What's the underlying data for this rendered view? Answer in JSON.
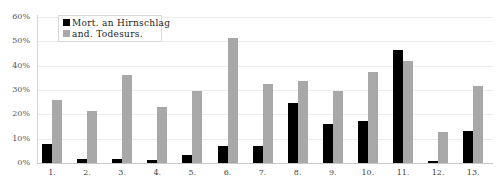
{
  "chart_data": {
    "type": "bar",
    "title": "",
    "xlabel": "",
    "ylabel": "",
    "categories": [
      "1.",
      "2.",
      "3.",
      "4.",
      "5.",
      "6.",
      "7.",
      "8.",
      "9.",
      "10.",
      "11.",
      "12.",
      "13."
    ],
    "series": [
      {
        "name": "Mort. an Hirnschlag",
        "color": "#000000",
        "values": [
          8,
          1.5,
          1.5,
          1.2,
          3.3,
          7,
          7,
          24.6,
          16,
          17.3,
          46.5,
          1,
          13.1
        ]
      },
      {
        "name": "and. Todesurs.",
        "color": "#a8a8a8",
        "values": [
          26,
          21.5,
          36,
          23,
          29.7,
          51.3,
          32.3,
          33.7,
          29.6,
          37.5,
          41.8,
          12.8,
          31.7
        ]
      }
    ],
    "ylim": [
      0,
      60
    ],
    "yticks": [
      "0%",
      "10%",
      "20%",
      "30%",
      "40%",
      "50%",
      "60%"
    ],
    "grid": true,
    "legend_position": "top-left"
  },
  "legend": {
    "items": [
      {
        "label": "Mort. an Hirnschlag",
        "color": "#000000"
      },
      {
        "label": "and. Todesurs.",
        "color": "#a8a8a8"
      }
    ]
  }
}
